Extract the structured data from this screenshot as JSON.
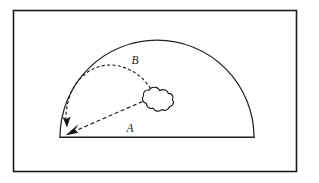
{
  "figure": {
    "background_color": "#ffffff",
    "stroke_color": "#1c1c1c",
    "frame": {
      "name": "outer-frame",
      "x": 13,
      "y": 10,
      "width": 284,
      "height": 162,
      "stroke_width": 1.6
    },
    "dome": {
      "name": "semicircle-dome",
      "center_x": 157,
      "center_y": 137,
      "radius": 97,
      "baseline_y": 137,
      "left_x": 60,
      "right_x": 254,
      "apex_x": 157,
      "apex_y": 40,
      "stroke_width": 1.2
    },
    "cloud": {
      "name": "cloud-blob",
      "center_x": 156,
      "center_y": 99,
      "radius_x": 16,
      "radius_y": 12,
      "lobes": 7,
      "stroke_width": 1.2
    },
    "paths": [
      {
        "id": "path-b",
        "label": "B",
        "style": "dashed-arc",
        "description": "curved dashed trajectory arcing up and over from the cloud to the arrowhead",
        "start_x": 150,
        "start_y": 88,
        "end_x": 67,
        "end_y": 124,
        "label_x": 135,
        "label_y": 60,
        "dash_pattern": "3,2.4",
        "stroke_width": 1.1,
        "arrow_direction": "down"
      },
      {
        "id": "path-a",
        "label": "A",
        "style": "dashed-straight",
        "description": "straight dashed trajectory from the cloud down-left to the arrowhead",
        "start_x": 142,
        "start_y": 101,
        "end_x": 69,
        "end_y": 133,
        "label_x": 130,
        "label_y": 129,
        "dash_pattern": "4,2.6",
        "stroke_width": 1.1,
        "arrow_direction": "down-left"
      }
    ],
    "labels": [
      {
        "name": "label-b",
        "text": "B",
        "x": 135,
        "y": 60
      },
      {
        "name": "label-a",
        "text": "A",
        "x": 130,
        "y": 129
      }
    ]
  }
}
